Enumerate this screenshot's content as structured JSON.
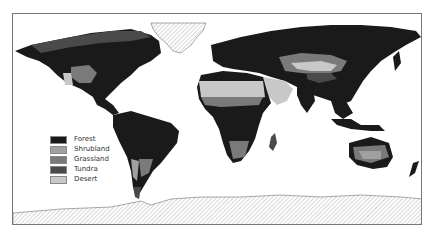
{
  "map": {
    "type": "world biome map",
    "projection": "equirectangular-like",
    "colors": {
      "forest": "#1a1a1a",
      "shrubland": "#a0a0a0",
      "grassland": "#7a7a7a",
      "tundra": "#4a4a4a",
      "desert": "#c8c8c8",
      "ice_hatch": "#999999"
    }
  },
  "legend": {
    "items": [
      {
        "label": "Forest",
        "color": "#1a1a1a"
      },
      {
        "label": "Shrubland",
        "color": "#a0a0a0"
      },
      {
        "label": "Grassland",
        "color": "#7a7a7a"
      },
      {
        "label": "Tundra",
        "color": "#4a4a4a"
      },
      {
        "label": "Desert",
        "color": "#c8c8c8"
      }
    ]
  }
}
